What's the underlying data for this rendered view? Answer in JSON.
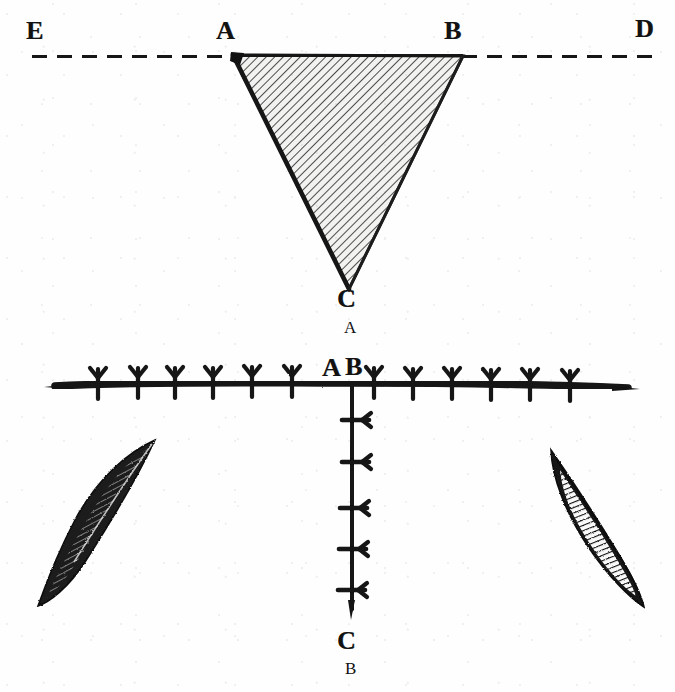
{
  "plate": {
    "title": "Anatomical plate with two lettered figures",
    "background_color": "#fefefe",
    "ink_color": "#121212",
    "width": 675,
    "height": 692
  },
  "figure_a": {
    "caption": "A",
    "caption_position": {
      "x": 347,
      "y": 320
    },
    "description": "Inverted hatched triangle A-B-C suspended from a horizontal dashed line E-D, with two short vertical dashed lines at the left and right margins",
    "labels": [
      {
        "id": "label-e",
        "text": "E",
        "x": 30,
        "y": 20
      },
      {
        "id": "label-a",
        "text": "A",
        "x": 220,
        "y": 20
      },
      {
        "id": "label-b",
        "text": "B",
        "x": 447,
        "y": 20
      },
      {
        "id": "label-d",
        "text": "D",
        "x": 638,
        "y": 18
      },
      {
        "id": "label-c",
        "text": "C",
        "x": 340,
        "y": 288
      }
    ],
    "triangle": {
      "fill": "#efefef",
      "hatch_color": "#2a2a2a",
      "hatch_angle_deg": 45,
      "vertices": [
        {
          "name": "A",
          "x": 232,
          "y": 54
        },
        {
          "name": "B",
          "x": 463,
          "y": 55
        },
        {
          "name": "C",
          "x": 348,
          "y": 289
        }
      ]
    },
    "dashed_horizontal": {
      "y": 57,
      "left_segment": {
        "x1": 32,
        "x2": 232
      },
      "right_segment": {
        "x1": 463,
        "x2": 655
      },
      "dash": "14 10",
      "width": 5
    },
    "dashed_verticals": [
      {
        "id": "left-margin-dash",
        "x": 22,
        "y1": 127,
        "y2": 292,
        "dash": "13 8",
        "width": 5
      },
      {
        "id": "right-margin-dash",
        "x": 655,
        "y1": 122,
        "y2": 290,
        "dash": "13 8",
        "width": 5
      }
    ]
  },
  "figure_b": {
    "caption": "B",
    "caption_position": {
      "x": 347,
      "y": 661
    },
    "description": "T-shaped suture line: a long horizontal sutured incision crossed at its centre by a vertical sutured incision running down to C, flanked by two dark lens-shaped wound flaps",
    "labels": [
      {
        "id": "label-a",
        "text": "A",
        "x": 325,
        "y": 360
      },
      {
        "id": "label-b",
        "text": "B",
        "x": 348,
        "y": 358
      },
      {
        "id": "label-c",
        "text": "C",
        "x": 340,
        "y": 630
      }
    ],
    "horizontal_incision": {
      "y": 385,
      "x1": 55,
      "x2": 628,
      "stitch_count": 12,
      "stitch_style": "y-fork"
    },
    "vertical_incision": {
      "x": 353,
      "y1": 385,
      "y2": 614,
      "stitch_count": 5,
      "stitch_style": "bar-with-fork"
    },
    "flaps": [
      {
        "id": "left-flap",
        "fill": "#1b1b1b",
        "hatched": true,
        "cx": 95,
        "cy": 522
      },
      {
        "id": "right-flap",
        "fill": "#1b1b1b",
        "hatched": true,
        "cx": 595,
        "cy": 525
      }
    ]
  }
}
